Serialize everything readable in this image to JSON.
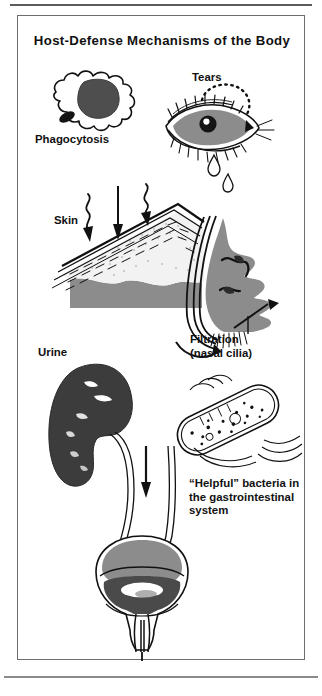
{
  "figure": {
    "title": "Host-Defense Mechanisms of the Body",
    "type": "medical-illustration",
    "panel_border_color": "#6d6d6d",
    "background_color": "#ffffff",
    "ink_color": "#111111",
    "mid_gray": "#8c8c8c",
    "dark_gray": "#4a4a4a",
    "light_gray": "#d8d8d8"
  },
  "labels": {
    "phagocytosis": "Phagocytosis",
    "tears": "Tears",
    "skin": "Skin",
    "filtration_line1": "Filtration",
    "filtration_line2": "(nasal cilia)",
    "urine": "Urine",
    "bacteria_line1": "“Helpful” bacteria in",
    "bacteria_line2": "the gastrointestinal",
    "bacteria_line3": "system"
  },
  "mechanisms": [
    {
      "name": "phagocytosis",
      "label": "Phagocytosis",
      "icon": "phagocyte-cell-icon",
      "description": "Amoeboid white blood cell with dark lobed nucleus engulfing a small dark bacterium",
      "region": "top-left"
    },
    {
      "name": "tears",
      "label": "Tears",
      "icon": "eye-icon",
      "description": "Eye with gray iris, dark pupil with white highlight, eyelashes, dotted lacrimal arc and two falling teardrops",
      "region": "top-right"
    },
    {
      "name": "skin",
      "label": "Skin",
      "icon": "skin-cross-section-icon",
      "description": "Diagonal layered skin cross-section, epidermal dashes, stippled dermis, gray subcutaneous layer; one straight and two wavy arrows striking the surface",
      "region": "middle-left"
    },
    {
      "name": "filtration",
      "label": "Filtration (nasal cilia)",
      "icon": "nose-profile-icon",
      "description": "Gray facial profile silhouette showing nasal passages, airflow lines and cilia with an arrow indicating filtration",
      "region": "middle-right"
    },
    {
      "name": "urine",
      "label": "Urine",
      "icon": "kidney-icon",
      "description": "Dark kidney with white internal calyces, ureter descending to bladder, downward flow arrow",
      "region": "lower-left"
    },
    {
      "name": "gi-flora",
      "label": "“Helpful” bacteria in the gastrointestinal system",
      "icon": "bacterium-icon",
      "description": "Rod-shaped bacterium with double-walled outline, internal granules and flagella",
      "region": "lower-right"
    },
    {
      "name": "bladder",
      "label": "",
      "icon": "bladder-icon",
      "description": "Urinary bladder with gray dome, dark lumen with white highlight, urethra and downward outflow arrow",
      "region": "bottom-center"
    }
  ]
}
